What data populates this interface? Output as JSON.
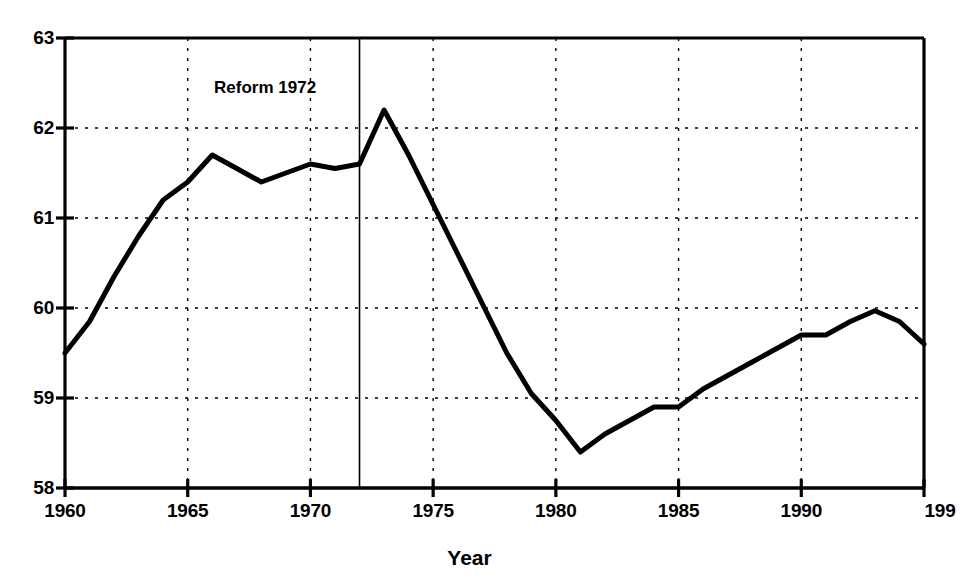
{
  "chart_data": {
    "type": "line",
    "title": "",
    "subtitle": "",
    "xlabel": "Year",
    "ylabel": "",
    "xlim": [
      1960,
      1995
    ],
    "ylim": [
      58,
      63
    ],
    "grid": true,
    "grid_style": "dotted horizontal and vertical",
    "legend": "none",
    "line_color": "#000000",
    "line_width": 5,
    "axis_color": "#000000",
    "background_color": "#ffffff",
    "x_ticks": [
      1960,
      1965,
      1970,
      1975,
      1980,
      1985,
      1990,
      1995
    ],
    "x_tick_labels": [
      "1960",
      "1965",
      "1970",
      "1975",
      "1980",
      "1985",
      "1990",
      "199"
    ],
    "y_ticks": [
      58,
      59,
      60,
      61,
      62,
      63
    ],
    "y_tick_labels": [
      "58",
      "59",
      "60",
      "61",
      "62",
      "63"
    ],
    "x": [
      1960,
      1961,
      1962,
      1963,
      1964,
      1965,
      1966,
      1967,
      1968,
      1969,
      1970,
      1971,
      1972,
      1973,
      1974,
      1975,
      1976,
      1977,
      1978,
      1979,
      1980,
      1981,
      1982,
      1983,
      1984,
      1985,
      1986,
      1987,
      1988,
      1989,
      1990,
      1991,
      1992,
      1993,
      1994,
      1995
    ],
    "values": [
      59.5,
      59.85,
      60.35,
      60.8,
      61.2,
      61.4,
      61.7,
      61.55,
      61.4,
      61.5,
      61.6,
      61.55,
      61.6,
      62.2,
      61.7,
      61.15,
      60.6,
      60.05,
      59.5,
      59.05,
      58.75,
      58.4,
      58.6,
      58.75,
      58.9,
      58.9,
      59.1,
      59.25,
      59.4,
      59.55,
      59.7,
      59.7,
      59.85,
      59.97,
      59.85,
      59.6
    ],
    "annotations": [
      {
        "name": "reform-marker",
        "label": "Reform 1972",
        "x": 1972,
        "type": "vertical-line-with-label",
        "line_color": "#000000",
        "label_x": 1968.6,
        "label_y": 62.45
      }
    ]
  }
}
